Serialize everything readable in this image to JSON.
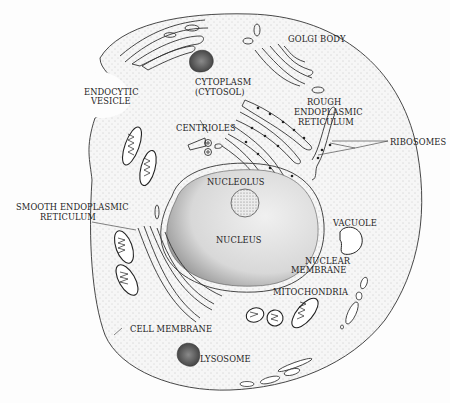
{
  "diagram": {
    "labels": {
      "golgi": "GOLGI BODY",
      "cytoplasm_1": "CYTOPLASM",
      "cytoplasm_2": "(CYTOSOL)",
      "endocytic_1": "ENDOCYTIC",
      "endocytic_2": "VESICLE",
      "rough_er_1": "ROUGH",
      "rough_er_2": "ENDOPLASMIC",
      "rough_er_3": "RETICULUM",
      "centrioles": "CENTRIOLES",
      "ribosomes": "RIBOSOMES",
      "nucleolus": "NUCLEOLUS",
      "smooth_er_1": "SMOOTH ENDOPLASMIC",
      "smooth_er_2": "RETICULUM",
      "nucleus": "NUCLEUS",
      "vacuole": "VACUOLE",
      "nuclear_membrane_1": "NUCLEAR",
      "nuclear_membrane_2": "MEMBRANE",
      "mitochondria": "MITOCHONDRIA",
      "cell_membrane": "CELL MEMBRANE",
      "lysosome": "LYSOSOME"
    },
    "colors": {
      "line": "#333333",
      "cytoplasm_stipple": "#f1f1f1",
      "nucleus_shade": "#e2e2e2",
      "dark_organelle": "#555555"
    }
  }
}
